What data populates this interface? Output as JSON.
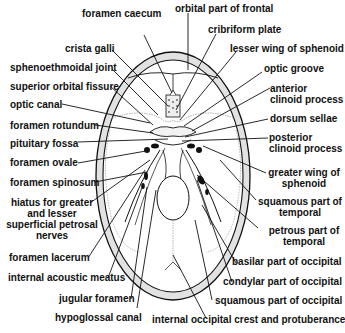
{
  "diagram": {
    "labels_left": [
      {
        "id": "foramen-caecum",
        "text": "foramen caecum"
      },
      {
        "id": "crista-galli",
        "text": "crista galli"
      },
      {
        "id": "sphenoethmoidal-joint",
        "text": "sphenoethmoidal joint"
      },
      {
        "id": "superior-orbital-fissure",
        "text": "superior orbital fissure"
      },
      {
        "id": "optic-canal",
        "text": "optic canal"
      },
      {
        "id": "foramen-rotundum",
        "text": "foramen rotundum"
      },
      {
        "id": "pituitary-fossa",
        "text": "pituitary fossa"
      },
      {
        "id": "foramen-ovale",
        "text": "foramen ovale"
      },
      {
        "id": "foramen-spinosum",
        "text": "foramen spinosum"
      },
      {
        "id": "hiatus",
        "text": "hiatus for greater and lesser superficial petrosal nerves",
        "lines": [
          "hiatus for greater",
          "and lesser",
          "superficial petrosal",
          "nerves"
        ]
      },
      {
        "id": "foramen-lacerum",
        "text": "foramen lacerum"
      },
      {
        "id": "internal-acoustic-meatus",
        "text": "internal acoustic meatus"
      },
      {
        "id": "jugular-foramen",
        "text": "jugular foramen"
      },
      {
        "id": "hypoglossal-canal",
        "text": "hypoglossal canal"
      }
    ],
    "labels_right": [
      {
        "id": "orbital-part-of-frontal",
        "text": "orbital part of frontal"
      },
      {
        "id": "cribriform-plate",
        "text": "cribriform plate"
      },
      {
        "id": "lesser-wing-of-sphenoid",
        "text": "lesser wing of sphenoid"
      },
      {
        "id": "optic-groove",
        "text": "optic groove"
      },
      {
        "id": "anterior-clinoid-process",
        "text": "anterior clinoid process",
        "lines": [
          "anterior",
          "clinoid process"
        ]
      },
      {
        "id": "dorsum-sellae",
        "text": "dorsum sellae"
      },
      {
        "id": "posterior-clinoid-process",
        "text": "posterior clinoid process",
        "lines": [
          "posterior",
          "clinoid process"
        ]
      },
      {
        "id": "greater-wing-of-sphenoid",
        "text": "greater wing of sphenoid",
        "lines": [
          "greater wing of",
          "sphenoid"
        ]
      },
      {
        "id": "squamous-part-of-temporal",
        "text": "squamous part of temporal",
        "lines": [
          "squamous part of",
          "temporal"
        ]
      },
      {
        "id": "petrous-part-of-temporal",
        "text": "petrous part of temporal",
        "lines": [
          "petrous part of",
          "temporal"
        ]
      },
      {
        "id": "basilar-part-of-occipital",
        "text": "basilar part of occipital"
      },
      {
        "id": "condylar-part-of-occipital",
        "text": "condylar part of occipital"
      },
      {
        "id": "squamous-part-of-occipital",
        "text": "squamous part of occipital"
      },
      {
        "id": "internal-occipital-crest",
        "text": "internal occipital crest and protuberance"
      }
    ],
    "colors": {
      "ink": "#111111",
      "bone_shade": "#dcdcdc",
      "background": "#ffffff"
    }
  }
}
